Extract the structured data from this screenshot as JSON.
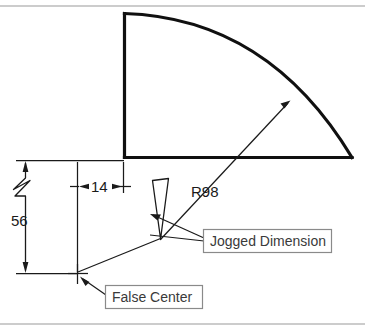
{
  "figure": {
    "background_color": "#ffffff",
    "object_line_color": "#101010",
    "dimension_line_color": "#1a1a1a",
    "callout_border_color": "#8a8a8a",
    "page_rule_color": "#9a9a9a"
  },
  "dimensions": {
    "radius_label": "R98",
    "horizontal_label": "14",
    "vertical_label": "56"
  },
  "callouts": {
    "jogged_dimension": "Jogged Dimension",
    "false_center": "False Center"
  },
  "geometry": {
    "arc_corner_x": 124,
    "arc_corner_y": 13,
    "arc_base_y": 157,
    "arc_end_x": 352,
    "false_center_x": 77,
    "false_center_y": 273,
    "upper_extension_y": 160,
    "lower_extension_y": 273
  }
}
